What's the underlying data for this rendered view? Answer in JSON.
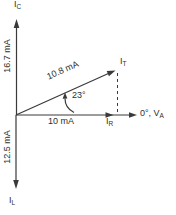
{
  "colors": {
    "line": "#3a3a3a",
    "text": "#2f2f2f",
    "background": "#ffffff"
  },
  "vectors": {
    "ic": {
      "label_main": "I",
      "label_sub": "C",
      "magnitude": "16.7 mA",
      "direction": "up"
    },
    "il": {
      "label_main": "I",
      "label_sub": "L",
      "magnitude": "12.5 mA",
      "direction": "down"
    },
    "ir": {
      "label_main": "I",
      "label_sub": "R",
      "magnitude": "10 mA",
      "direction": "right"
    },
    "it": {
      "label_main": "I",
      "label_sub": "T",
      "magnitude": "10.8 mA",
      "angle": "23°"
    }
  },
  "axis": {
    "reference_label_main": "0°, V",
    "reference_label_sub": "A"
  }
}
